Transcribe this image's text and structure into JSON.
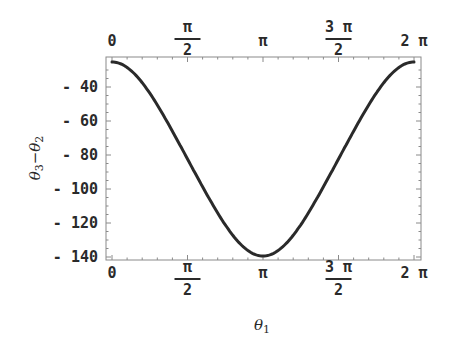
{
  "chart_data": {
    "type": "line",
    "title": "",
    "xlabel": "θ1",
    "ylabel": "θ3−θ2",
    "xlim": [
      0,
      6.2832
    ],
    "ylim": [
      -142,
      -22
    ],
    "x_ticks": [
      {
        "value": 0,
        "label": "0"
      },
      {
        "value": 1.5708,
        "label": "π/2"
      },
      {
        "value": 3.1416,
        "label": "π"
      },
      {
        "value": 4.7124,
        "label": "3π/2"
      },
      {
        "value": 6.2832,
        "label": "2π"
      }
    ],
    "y_ticks": [
      -40,
      -60,
      -80,
      -100,
      -120,
      -140
    ],
    "grid": false,
    "frame": true,
    "ticks_on_top_axis": true,
    "series": [
      {
        "name": "θ3−θ2",
        "color": "#2a2a2a",
        "x": [
          0,
          0.3927,
          0.7854,
          1.1781,
          1.5708,
          1.9635,
          2.3562,
          2.7489,
          3.1416,
          3.5343,
          3.927,
          4.3197,
          4.7124,
          5.1051,
          5.4978,
          5.8905,
          6.2832
        ],
        "y": [
          -25.3,
          -30,
          -43,
          -61,
          -82,
          -103,
          -121,
          -134,
          -139.4,
          -134,
          -121,
          -103,
          -82,
          -61,
          -43,
          -30,
          -25.3
        ]
      }
    ]
  }
}
